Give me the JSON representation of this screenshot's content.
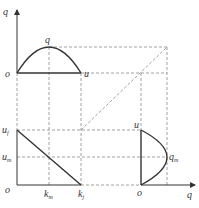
{
  "figure": {
    "colors": {
      "curve": "#333333",
      "dashed": "#888888",
      "axis": "#333333"
    }
  },
  "top_left": {
    "axis_y_label": "q",
    "origin_label": "o",
    "peak_label": "q",
    "x_end_label": "u"
  },
  "bottom_left": {
    "y_labels": {
      "uf_main": "u",
      "uf_sub": "f",
      "um_main": "u",
      "um_sub": "m"
    },
    "origin_label": "o",
    "x_labels": {
      "km_main": "k",
      "km_sub": "m",
      "kj_main": "k",
      "kj_sub": "j"
    }
  },
  "bottom_right": {
    "axis_y_label": "u",
    "origin_label": "o",
    "axis_x_label": "q",
    "qm_main": "q",
    "qm_sub": "m"
  }
}
